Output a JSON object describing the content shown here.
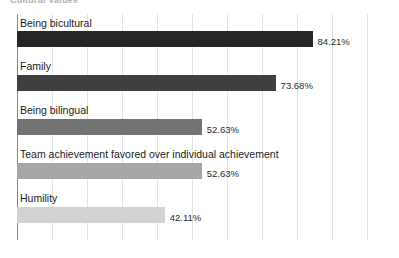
{
  "chart_data": {
    "type": "bar",
    "orientation": "horizontal",
    "title": "Cultural Values",
    "xlabel": "",
    "ylabel": "",
    "xlim": [
      0,
      100
    ],
    "grid": true,
    "legend": "none",
    "value_suffix": "%",
    "categories": [
      "Being bicultural",
      "Family",
      "Being bilingual",
      "Team achievement favored over individual achievement",
      "Humility"
    ],
    "values": [
      84.21,
      73.68,
      52.63,
      52.63,
      42.11
    ],
    "value_labels": [
      "84.21%",
      "73.68%",
      "52.63%",
      "52.63%",
      "42.11%"
    ],
    "colors": [
      "#262626",
      "#3f3f3f",
      "#737373",
      "#a6a6a6",
      "#d2d2d2"
    ],
    "gridline_count": 11,
    "gridline_color": "#e3e3e3",
    "axis_color": "#8a8a8a",
    "background": "#ffffff"
  },
  "bars": [
    {
      "label": "Being bicultural",
      "value_label": "84.21%",
      "value": 84.21,
      "color": "#262626",
      "label_top": 2,
      "bar_top": 17,
      "bar_height": 16
    },
    {
      "label": "Family",
      "value_label": "73.68%",
      "value": 73.68,
      "color": "#3f3f3f",
      "label_top": 45,
      "bar_top": 61,
      "bar_height": 16
    },
    {
      "label": "Being bilingual",
      "value_label": "52.63%",
      "value": 52.63,
      "color": "#737373",
      "label_top": 89,
      "bar_top": 105,
      "bar_height": 16
    },
    {
      "label": "Team achievement favored over individual achievement",
      "value_label": "52.63%",
      "value": 52.63,
      "color": "#a6a6a6",
      "label_top": 133,
      "bar_top": 149,
      "bar_height": 16
    },
    {
      "label": "Humility",
      "value_label": "42.11%",
      "value": 42.11,
      "color": "#d2d2d2",
      "label_top": 177,
      "bar_top": 193,
      "bar_height": 16
    }
  ]
}
